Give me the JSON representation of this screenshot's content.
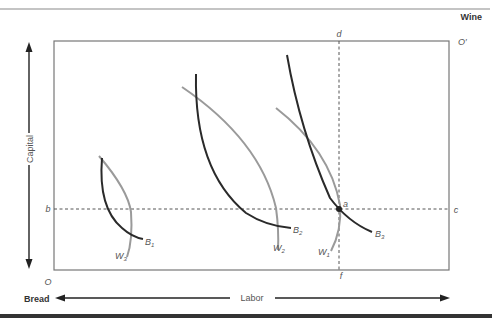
{
  "diagram": {
    "type": "edgeworth-box",
    "goods": {
      "top_right": "Wine",
      "bottom_left": "Bread"
    },
    "axes": {
      "horizontal": "Labor",
      "vertical": "Capital"
    },
    "origins": {
      "bread": "O",
      "wine": "O′"
    },
    "points": {
      "b": "b",
      "c": "c",
      "d": "d",
      "f": "f",
      "a": "a"
    },
    "isoquants": {
      "bread": [
        {
          "name": "B",
          "sub": "1"
        },
        {
          "name": "B",
          "sub": "2"
        },
        {
          "name": "B",
          "sub": "3"
        }
      ],
      "wine": [
        {
          "name": "W",
          "sub": "3"
        },
        {
          "name": "W",
          "sub": "2"
        },
        {
          "name": "W",
          "sub": "1"
        }
      ]
    },
    "colors": {
      "bread_curve": "#2a2a2a",
      "wine_curve": "#9a9a9a",
      "box": "#777777",
      "dashed": "#555555",
      "rule": "#333333"
    }
  }
}
